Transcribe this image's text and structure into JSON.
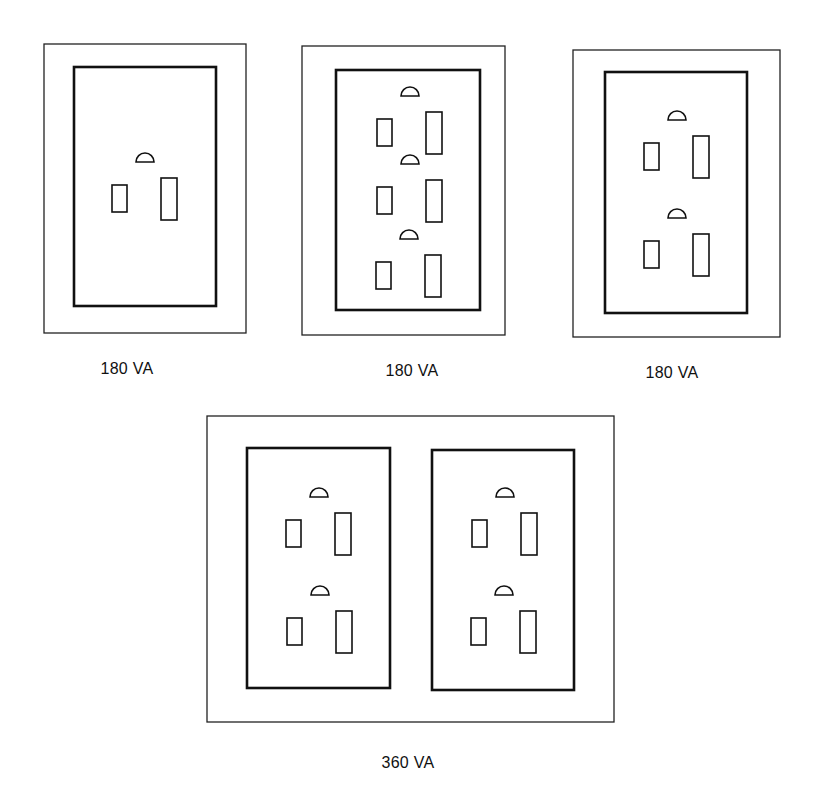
{
  "figure": {
    "plates": [
      {
        "id": "single-receptacle",
        "label": "180 VA",
        "receptacle_count": 1,
        "outer": [
          44,
          44,
          202,
          289
        ],
        "inners": [
          [
            74,
            67,
            142,
            239
          ]
        ],
        "outlets": [
          [
            145,
            178
          ]
        ],
        "label_pos": [
          127,
          360
        ]
      },
      {
        "id": "triplex-receptacle",
        "label": "180 VA",
        "receptacle_count": 3,
        "outer": [
          302,
          46,
          203,
          289
        ],
        "inners": [
          [
            336,
            70,
            144,
            240
          ]
        ],
        "outlets": [
          [
            410,
            112
          ],
          [
            410,
            180
          ],
          [
            409,
            255
          ]
        ],
        "label_pos": [
          412,
          362
        ]
      },
      {
        "id": "duplex-receptacle",
        "label": "180 VA",
        "receptacle_count": 2,
        "outer": [
          573,
          50,
          207,
          287
        ],
        "inners": [
          [
            605,
            72,
            142,
            241
          ]
        ],
        "outlets": [
          [
            677,
            136
          ],
          [
            677,
            234
          ]
        ],
        "label_pos": [
          672,
          364
        ]
      },
      {
        "id": "double-duplex-receptacle",
        "label": "360 VA",
        "receptacle_count": 4,
        "outer": [
          207,
          416,
          407,
          306
        ],
        "inners": [
          [
            247,
            448,
            143,
            240
          ],
          [
            432,
            450,
            142,
            240
          ]
        ],
        "outlets": [
          [
            319,
            513
          ],
          [
            320,
            611
          ],
          [
            505,
            513
          ],
          [
            504,
            611
          ]
        ],
        "label_pos": [
          408,
          754
        ]
      }
    ],
    "outlet_geometry": {
      "ground_radius": 9,
      "ground_offset_y": -16,
      "neutral": {
        "dx": -33,
        "dy": 7,
        "w": 15,
        "h": 27
      },
      "hot": {
        "dx": 16,
        "dy": 0,
        "w": 16,
        "h": 42
      }
    }
  },
  "colors": {
    "line": "#111111",
    "background": "#ffffff"
  }
}
